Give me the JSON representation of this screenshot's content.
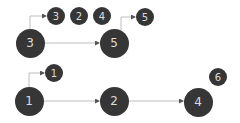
{
  "diagram": {
    "colors": {
      "node_fill": "#363636",
      "node_text": "#dcdcdc",
      "edge": "#bdbdbd",
      "background": "#ffffff"
    },
    "nodes": [
      {
        "id": "n3_big",
        "label": "3",
        "size": "large",
        "cx": 30,
        "cy": 43
      },
      {
        "id": "n3_small",
        "label": "3",
        "size": "small",
        "cx": 56,
        "cy": 16
      },
      {
        "id": "n2_small",
        "label": "2",
        "size": "small",
        "cx": 79,
        "cy": 16
      },
      {
        "id": "n4_small",
        "label": "4",
        "size": "small",
        "cx": 102,
        "cy": 16
      },
      {
        "id": "n5_big",
        "label": "5",
        "size": "large",
        "cx": 114,
        "cy": 43
      },
      {
        "id": "n5_small",
        "label": "5",
        "size": "small",
        "cx": 145,
        "cy": 17
      },
      {
        "id": "n1_small",
        "label": "1",
        "size": "small",
        "cx": 54,
        "cy": 73
      },
      {
        "id": "n1_big",
        "label": "1",
        "size": "large",
        "cx": 29,
        "cy": 101
      },
      {
        "id": "n2_big",
        "label": "2",
        "size": "large",
        "cx": 114,
        "cy": 101
      },
      {
        "id": "n4_big",
        "label": "4",
        "size": "large",
        "cx": 198,
        "cy": 102
      },
      {
        "id": "n6_small",
        "label": "6",
        "size": "small",
        "cx": 218,
        "cy": 77
      }
    ],
    "edges": [
      {
        "from": "n3_big",
        "to": "n3_small",
        "type": "elbow",
        "points": "30,29 30,16 46,16"
      },
      {
        "from": "n3_big",
        "to": "n5_big",
        "type": "straight",
        "points": "44,43 99,43"
      },
      {
        "from": "n5_big",
        "to": "n5_small",
        "type": "elbow",
        "points": "121,30 121,17 135,17"
      },
      {
        "from": "n1_big",
        "to": "n1_small",
        "type": "elbow",
        "points": "29,87 29,73 44,73"
      },
      {
        "from": "n1_big",
        "to": "n2_big",
        "type": "straight",
        "points": "43,101 99,101"
      },
      {
        "from": "n2_big",
        "to": "n4_big",
        "type": "straight",
        "points": "128,101 183,101"
      }
    ]
  }
}
